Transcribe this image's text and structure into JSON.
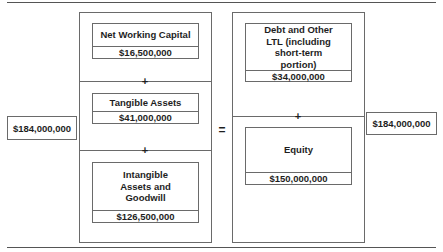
{
  "diagram": {
    "left_total": "$184,000,000",
    "right_total": "$184,000,000",
    "equals_symbol": "=",
    "plus_symbol": "+",
    "assets_column": {
      "items": [
        {
          "label": "Net Working Capital",
          "value": "$16,500,000"
        },
        {
          "label": "Tangible Assets",
          "value": "$41,000,000"
        },
        {
          "label": "Intangible Assets and Goodwill",
          "value": "$126,500,000"
        }
      ]
    },
    "capital_column": {
      "items": [
        {
          "label": "Debt and Other LTL (including short-term portion)",
          "value": "$34,000,000"
        },
        {
          "label": "Equity",
          "value": "$150,000,000"
        }
      ]
    }
  }
}
